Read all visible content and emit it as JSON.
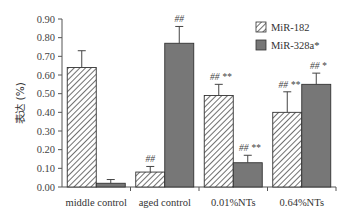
{
  "chart_data": {
    "type": "bar",
    "title": "",
    "xlabel": "",
    "ylabel": "表达 (%)",
    "ylim": [
      0,
      0.9
    ],
    "yticks": [
      "0.00",
      "0.10",
      "0.20",
      "0.30",
      "0.40",
      "0.50",
      "0.60",
      "0.70",
      "0.80",
      "0.90"
    ],
    "grid": false,
    "legend_position": "top-right",
    "categories": [
      "middle control",
      "aged control",
      "0.01%NTs",
      "0.64%NTs"
    ],
    "series": [
      {
        "name": "MiR-182",
        "pattern": "hatched",
        "values": [
          0.64,
          0.08,
          0.49,
          0.4
        ],
        "error": [
          0.09,
          0.03,
          0.06,
          0.11
        ],
        "annotations": [
          "",
          "##",
          "## **",
          "## **"
        ]
      },
      {
        "name": "MiR-328a*",
        "pattern": "solid",
        "color": "#777777",
        "values": [
          0.02,
          0.77,
          0.13,
          0.55
        ],
        "error": [
          0.02,
          0.09,
          0.04,
          0.06
        ],
        "annotations": [
          "",
          "##",
          "## **",
          "## *"
        ]
      }
    ]
  },
  "legend": {
    "items": [
      {
        "label": "MiR-182"
      },
      {
        "label": "MiR-328a*"
      }
    ]
  }
}
